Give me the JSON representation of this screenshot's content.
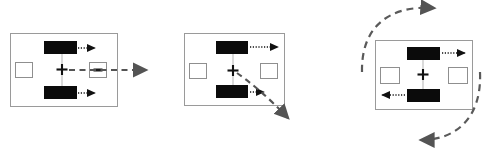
{
  "figure": {
    "title": "",
    "background_color": "#ffffff",
    "width": 492,
    "height": 151,
    "panel_count": 3
  },
  "colors": {
    "frame_stroke": "#9a9a9a",
    "bar_fill": "#0b0b0b",
    "slot_stroke": "#8f8f8f",
    "dotted_arrow": "#111111",
    "dashed_arrow": "#545454",
    "arc_arrow": "#5a5a5a",
    "connector": "#b5b5b5",
    "cross_marker": "#111111"
  },
  "panels": [
    {
      "id": "panel-translation",
      "label": "",
      "motion": "straight-translation-right",
      "frame": {
        "x": 10,
        "y": 33,
        "w": 108,
        "h": 74
      },
      "center_marker": "cross",
      "bars": [
        {
          "name": "upper-bar",
          "state": "filled",
          "arrow": "dotted-right"
        },
        {
          "name": "lower-bar",
          "state": "filled",
          "arrow": "dotted-right"
        }
      ],
      "slots": [
        {
          "name": "left-slot",
          "state": "empty"
        },
        {
          "name": "right-slot",
          "state": "bar-inside"
        }
      ],
      "resultant_arrow": {
        "name": "resultant-translation-arrow",
        "style": "dashed",
        "direction": "right"
      }
    },
    {
      "id": "panel-curved-translation",
      "label": "",
      "motion": "curved-translation-down-right",
      "frame": {
        "x": 184,
        "y": 33,
        "w": 101,
        "h": 73
      },
      "center_marker": "cross",
      "bars": [
        {
          "name": "upper-bar",
          "state": "filled",
          "arrow": "dotted-right"
        },
        {
          "name": "lower-bar",
          "state": "filled",
          "arrow": "dotted-right"
        }
      ],
      "slots": [
        {
          "name": "left-slot",
          "state": "empty"
        },
        {
          "name": "right-slot",
          "state": "empty"
        }
      ],
      "resultant_arrow": {
        "name": "resultant-curve-arrow",
        "style": "dashed-curve",
        "direction": "down-right"
      }
    },
    {
      "id": "panel-rotation",
      "label": "",
      "motion": "rotation",
      "frame": {
        "x": 375,
        "y": 40,
        "w": 98,
        "h": 70
      },
      "center_marker": "cross",
      "bars": [
        {
          "name": "upper-bar",
          "state": "filled",
          "arrow": "dotted-right"
        },
        {
          "name": "lower-bar",
          "state": "filled",
          "arrow": "dotted-left"
        }
      ],
      "slots": [
        {
          "name": "left-slot",
          "state": "empty"
        },
        {
          "name": "right-slot",
          "state": "empty"
        }
      ],
      "resultant_arrow": {
        "name": "resultant-rotation-arcs",
        "style": "dashed-arc-pair",
        "direction": "counter-rotating"
      }
    }
  ]
}
